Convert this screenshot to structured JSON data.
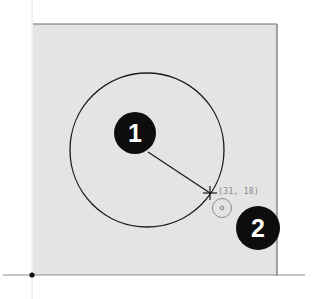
{
  "canvas": {
    "background": "#ffffff",
    "sheet_fill": "#e4e4e4",
    "sheet_border": "#6b6b6b",
    "axis_color": "#b0b0b0"
  },
  "sketch": {
    "circle": {
      "cx": 147,
      "cy": 150,
      "r": 77,
      "stroke": "#1a1a1a"
    },
    "radius_line": {
      "from": [
        148,
        152
      ],
      "to": [
        210,
        193
      ]
    },
    "cursor_coordinate_label": "(31, 18)",
    "snap_indicator_color": "#8a8a8a",
    "origin_point": [
      32,
      275
    ]
  },
  "callouts": [
    {
      "label": "1",
      "cx": 135,
      "cy": 133,
      "r": 21
    },
    {
      "label": "2",
      "cx": 258,
      "cy": 228,
      "r": 22
    }
  ]
}
